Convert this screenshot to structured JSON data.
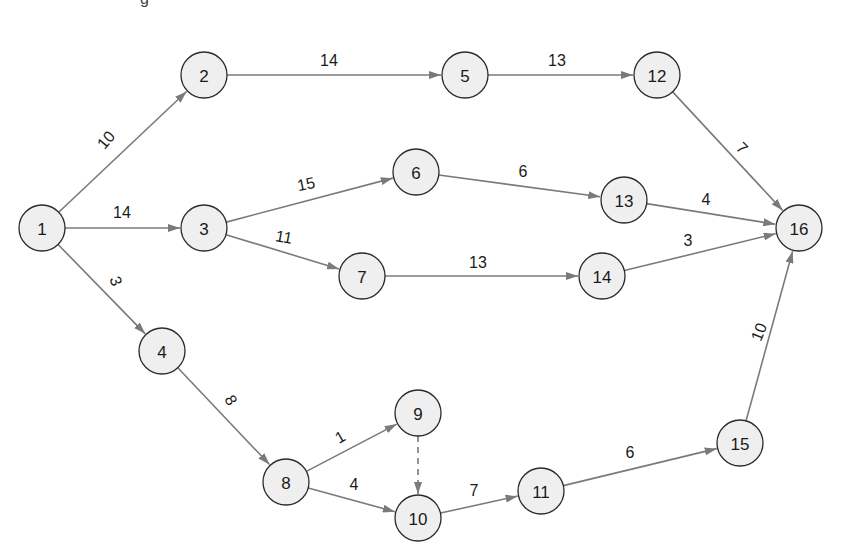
{
  "diagram": {
    "type": "activity-network",
    "colors": {
      "node_fill": "#efefef",
      "node_stroke": "#2b2b2b",
      "edge": "#7a7a7a",
      "text": "#1a1a1a"
    },
    "nodes": [
      {
        "id": "1",
        "label": "1",
        "x": 42,
        "y": 228
      },
      {
        "id": "2",
        "label": "2",
        "x": 204,
        "y": 75
      },
      {
        "id": "3",
        "label": "3",
        "x": 204,
        "y": 228
      },
      {
        "id": "4",
        "label": "4",
        "x": 162,
        "y": 351
      },
      {
        "id": "5",
        "label": "5",
        "x": 465,
        "y": 75
      },
      {
        "id": "6",
        "label": "6",
        "x": 416,
        "y": 172
      },
      {
        "id": "7",
        "label": "7",
        "x": 362,
        "y": 276
      },
      {
        "id": "8",
        "label": "8",
        "x": 286,
        "y": 482
      },
      {
        "id": "9",
        "label": "9",
        "x": 418,
        "y": 413
      },
      {
        "id": "10",
        "label": "10",
        "x": 418,
        "y": 518
      },
      {
        "id": "11",
        "label": "11",
        "x": 541,
        "y": 491
      },
      {
        "id": "12",
        "label": "12",
        "x": 657,
        "y": 75
      },
      {
        "id": "13",
        "label": "13",
        "x": 624,
        "y": 200
      },
      {
        "id": "14",
        "label": "14",
        "x": 602,
        "y": 276
      },
      {
        "id": "15",
        "label": "15",
        "x": 740,
        "y": 443
      },
      {
        "id": "16",
        "label": "16",
        "x": 799,
        "y": 228
      }
    ],
    "edges": [
      {
        "from": "1",
        "to": "2",
        "label": "10",
        "lx": 106,
        "ly": 140,
        "rot": -50
      },
      {
        "from": "1",
        "to": "3",
        "label": "14",
        "lx": 122,
        "ly": 212,
        "rot": 0
      },
      {
        "from": "1",
        "to": "4",
        "label": "3",
        "lx": 116,
        "ly": 281,
        "rot": 70
      },
      {
        "from": "2",
        "to": "5",
        "label": "14",
        "lx": 329,
        "ly": 60,
        "rot": 0
      },
      {
        "from": "5",
        "to": "12",
        "label": "13",
        "lx": 557,
        "ly": 60,
        "rot": 0
      },
      {
        "from": "3",
        "to": "6",
        "label": "15",
        "lx": 306,
        "ly": 184,
        "rot": -12
      },
      {
        "from": "3",
        "to": "7",
        "label": "11",
        "lx": 284,
        "ly": 237,
        "rot": 10
      },
      {
        "from": "6",
        "to": "13",
        "label": "6",
        "lx": 523,
        "ly": 171,
        "rot": 0
      },
      {
        "from": "7",
        "to": "14",
        "label": "13",
        "lx": 478,
        "ly": 262,
        "rot": 0
      },
      {
        "from": "12",
        "to": "16",
        "label": "7",
        "lx": 742,
        "ly": 148,
        "rot": 45
      },
      {
        "from": "13",
        "to": "16",
        "label": "4",
        "lx": 706,
        "ly": 199,
        "rot": 0
      },
      {
        "from": "14",
        "to": "16",
        "label": "3",
        "lx": 688,
        "ly": 240,
        "rot": 0
      },
      {
        "from": "4",
        "to": "8",
        "label": "8",
        "lx": 231,
        "ly": 400,
        "rot": 60
      },
      {
        "from": "8",
        "to": "9",
        "label": "1",
        "lx": 340,
        "ly": 437,
        "rot": -30
      },
      {
        "from": "8",
        "to": "10",
        "label": "4",
        "lx": 354,
        "ly": 484,
        "rot": 0
      },
      {
        "from": "9",
        "to": "10",
        "label": "",
        "dashed": true
      },
      {
        "from": "10",
        "to": "11",
        "label": "7",
        "lx": 474,
        "ly": 490,
        "rot": 0
      },
      {
        "from": "11",
        "to": "15",
        "label": "6",
        "lx": 630,
        "ly": 452,
        "rot": 0
      },
      {
        "from": "15",
        "to": "16",
        "label": "10",
        "lx": 759,
        "ly": 332,
        "rot": -68
      }
    ],
    "partial_top_glyph": "g"
  }
}
